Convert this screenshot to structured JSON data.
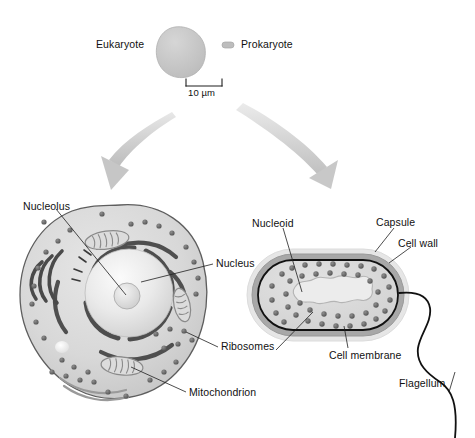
{
  "figure": {
    "top_row": {
      "eukaryote_label": "Eukaryote",
      "prokaryote_label": "Prokaryote",
      "scale_bar_label": "10 µm"
    },
    "eukaryote_cell": {
      "labels": [
        {
          "key": "nucleolus",
          "text": "Nucleolus"
        },
        {
          "key": "nucleus",
          "text": "Nucleus"
        },
        {
          "key": "ribosomes",
          "text": "Ribosomes"
        },
        {
          "key": "mitochondrion",
          "text": "Mitochondrion"
        }
      ]
    },
    "prokaryote_cell": {
      "labels": [
        {
          "key": "nucleoid",
          "text": "Nucleoid"
        },
        {
          "key": "capsule",
          "text": "Capsule"
        },
        {
          "key": "cell_wall",
          "text": "Cell wall"
        },
        {
          "key": "cell_membrane",
          "text": "Cell membrane"
        },
        {
          "key": "flagellum",
          "text": "Flagellum"
        }
      ]
    },
    "caption": "",
    "colors": {
      "cytoplasm": "#d9d9d9",
      "cell_outline": "#4a4a4a",
      "organelle_dark": "#5a5a5a",
      "ribosome": "#6e6e6e",
      "arrow_gray": "#c4c4c4",
      "capsule": "#e3e3e3",
      "cell_wall": "#9a9a9a",
      "nucleoid": "#e8e8e8",
      "label_text": "#111111",
      "leader_line": "#2b2b2b"
    }
  }
}
